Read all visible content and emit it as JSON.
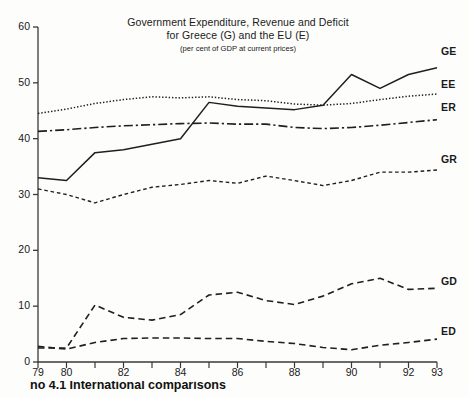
{
  "chart_data": {
    "type": "line",
    "title": "Government Expenditure, Revenue and Deficit",
    "title_line2": "for Greece (G) and the EU (E)",
    "subtitle": "(per cent of GDP at current prices)",
    "xlabel": "",
    "ylabel": "",
    "xlim": [
      79,
      93
    ],
    "ylim": [
      0,
      60
    ],
    "grid": false,
    "legend_position": "right-inline",
    "x": [
      79,
      80,
      81,
      82,
      83,
      84,
      85,
      86,
      87,
      88,
      89,
      90,
      91,
      92,
      93
    ],
    "xtick_labels": [
      "79",
      "80",
      "82",
      "84",
      "86",
      "88",
      "90",
      "92",
      "93"
    ],
    "ytick_labels": [
      "0",
      "10",
      "20",
      "30",
      "40",
      "50",
      "60"
    ],
    "series": [
      {
        "name": "GE",
        "label": "GE",
        "description": "Greece government expenditure",
        "style": "solid",
        "values": [
          33.0,
          32.5,
          37.5,
          38.0,
          39.0,
          40.0,
          46.5,
          45.8,
          45.5,
          45.2,
          46.0,
          51.5,
          49.0,
          51.5,
          52.7
        ]
      },
      {
        "name": "EE",
        "label": "EE",
        "description": "EU government expenditure",
        "style": "dotted",
        "values": [
          44.5,
          45.3,
          46.3,
          47.0,
          47.5,
          47.3,
          47.5,
          47.0,
          46.8,
          46.2,
          46.0,
          46.3,
          47.0,
          47.6,
          48.0
        ]
      },
      {
        "name": "ER",
        "label": "ER",
        "description": "EU government revenue",
        "style": "dash-dot",
        "values": [
          41.3,
          41.6,
          42.0,
          42.3,
          42.5,
          42.7,
          42.8,
          42.6,
          42.6,
          42.0,
          41.8,
          42.0,
          42.4,
          42.9,
          43.4
        ]
      },
      {
        "name": "GR",
        "label": "GR",
        "description": "Greece government revenue",
        "style": "dashed-fine",
        "values": [
          31.0,
          30.0,
          28.5,
          30.0,
          31.3,
          31.8,
          32.5,
          32.0,
          33.3,
          32.5,
          31.6,
          32.5,
          34.0,
          34.0,
          34.4
        ]
      },
      {
        "name": "GD",
        "label": "GD",
        "description": "Greece government deficit",
        "style": "dashed",
        "values": [
          2.5,
          2.5,
          10.2,
          8.0,
          7.5,
          8.5,
          12.0,
          12.5,
          11.0,
          10.3,
          11.8,
          14.0,
          15.0,
          13.0,
          13.2
        ]
      },
      {
        "name": "ED",
        "label": "ED",
        "description": "EU government deficit",
        "style": "dashed",
        "values": [
          2.8,
          2.3,
          3.5,
          4.2,
          4.3,
          4.3,
          4.2,
          4.2,
          3.7,
          3.3,
          2.6,
          2.2,
          3.0,
          3.5,
          4.1
        ]
      }
    ]
  },
  "top_bleed_text": "",
  "caption": "no 4.1  International comparisons"
}
